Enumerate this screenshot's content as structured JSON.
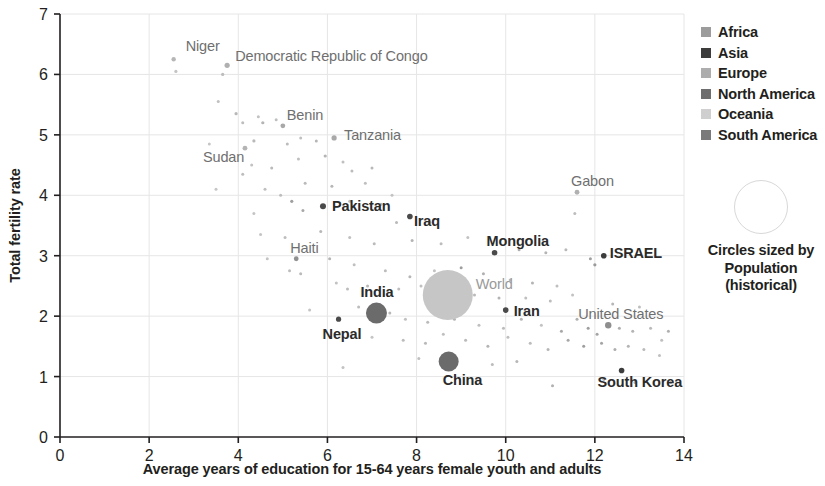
{
  "chart_data": {
    "type": "scatter",
    "title": "",
    "xlabel": "Average years of education for 15-64 years female youth and adults",
    "ylabel": "Total fertility rate",
    "xlim": [
      0,
      14
    ],
    "ylim": [
      0,
      7
    ],
    "xticks": [
      "0",
      "2",
      "4",
      "6",
      "8",
      "10",
      "12",
      "14"
    ],
    "yticks": [
      "0",
      "1",
      "2",
      "3",
      "4",
      "5",
      "6",
      "7"
    ],
    "grid": true,
    "legend_position": "right",
    "size_encoding": "Population (historical)",
    "legend": {
      "entries": [
        {
          "label": "Africa",
          "color": "#9c9c9c"
        },
        {
          "label": "Asia",
          "color": "#3c3c3c"
        },
        {
          "label": "Europe",
          "color": "#adadad"
        },
        {
          "label": "North America",
          "color": "#6e6e6e"
        },
        {
          "label": "Oceania",
          "color": "#cfcfcf"
        },
        {
          "label": "South America",
          "color": "#7a7a7a"
        }
      ]
    },
    "size_note": {
      "line1": "Circles sized by",
      "line2": "Population",
      "line3": "(historical)"
    },
    "labeled_points": [
      {
        "name": "Niger",
        "x": 2.55,
        "y": 6.25,
        "r": 2.2,
        "color": "#b6b6b6",
        "continent": "Africa",
        "label_dx": 12,
        "label_dy": -8,
        "label_style": "mid"
      },
      {
        "name": "Democratic Republic of Congo",
        "x": 3.75,
        "y": 6.15,
        "r": 2.6,
        "color": "#b0b0b0",
        "continent": "Africa",
        "label_dx": 8,
        "label_dy": -4,
        "label_style": "mid"
      },
      {
        "name": "Sudan",
        "x": 4.15,
        "y": 4.78,
        "r": 2.4,
        "color": "#b4b4b4",
        "continent": "Africa",
        "label_dx": -42,
        "label_dy": 14,
        "label_style": "mid"
      },
      {
        "name": "Benin",
        "x": 5.0,
        "y": 5.15,
        "r": 2.4,
        "color": "#a8a8a8",
        "continent": "Africa",
        "label_dx": 4,
        "label_dy": -6,
        "label_style": "mid"
      },
      {
        "name": "Tanzania",
        "x": 6.15,
        "y": 4.95,
        "r": 2.6,
        "color": "#a8a8a8",
        "continent": "Africa",
        "label_dx": 10,
        "label_dy": 2,
        "label_style": "mid"
      },
      {
        "name": "Pakistan",
        "x": 5.9,
        "y": 3.82,
        "r": 3.0,
        "color": "#4a4a4a",
        "continent": "Asia",
        "label_dx": 9,
        "label_dy": 5,
        "label_style": "dark"
      },
      {
        "name": "Iraq",
        "x": 7.85,
        "y": 3.65,
        "r": 2.8,
        "color": "#4a4a4a",
        "continent": "Asia",
        "label_dx": 4,
        "label_dy": 10,
        "label_style": "dark"
      },
      {
        "name": "Haiti",
        "x": 5.3,
        "y": 2.95,
        "r": 2.4,
        "color": "#909090",
        "continent": "North America",
        "label_dx": -6,
        "label_dy": -6,
        "label_style": "mid"
      },
      {
        "name": "Gabon",
        "x": 11.6,
        "y": 4.05,
        "r": 2.4,
        "color": "#b0b0b0",
        "continent": "Africa",
        "label_dx": -6,
        "label_dy": -6,
        "label_style": "mid"
      },
      {
        "name": "Mongolia",
        "x": 9.75,
        "y": 3.05,
        "r": 2.8,
        "color": "#4a4a4a",
        "continent": "Asia",
        "label_dx": -8,
        "label_dy": -7,
        "label_style": "dark"
      },
      {
        "name": "ISRAEL",
        "x": 12.2,
        "y": 3.0,
        "r": 2.8,
        "color": "#3c3c3c",
        "continent": "Asia",
        "label_dx": 6,
        "label_dy": 2,
        "label_style": "dark"
      },
      {
        "name": "World",
        "x": 8.7,
        "y": 2.35,
        "r": 25.0,
        "color": "#c6c6c6",
        "continent": "World",
        "label_dx": 28,
        "label_dy": -6,
        "label_style": "light"
      },
      {
        "name": "India",
        "x": 7.1,
        "y": 2.05,
        "r": 10.5,
        "color": "#6b6b6b",
        "continent": "Asia",
        "label_dx": -16,
        "label_dy": -16,
        "label_style": "dark"
      },
      {
        "name": "Nepal",
        "x": 6.25,
        "y": 1.95,
        "r": 2.6,
        "color": "#4a4a4a",
        "continent": "Asia",
        "label_dx": -16,
        "label_dy": 20,
        "label_style": "dark"
      },
      {
        "name": "Iran",
        "x": 10.0,
        "y": 2.1,
        "r": 2.8,
        "color": "#4a4a4a",
        "continent": "Asia",
        "label_dx": 8,
        "label_dy": 6,
        "label_style": "dark"
      },
      {
        "name": "China",
        "x": 8.72,
        "y": 1.25,
        "r": 10.0,
        "color": "#6b6b6b",
        "continent": "Asia",
        "label_dx": -6,
        "label_dy": 24,
        "label_style": "dark"
      },
      {
        "name": "United States",
        "x": 12.3,
        "y": 1.85,
        "r": 3.2,
        "color": "#8e8e8e",
        "continent": "North America",
        "label_dx": -30,
        "label_dy": -6,
        "label_style": "mid"
      },
      {
        "name": "South Korea",
        "x": 12.6,
        "y": 1.1,
        "r": 2.8,
        "color": "#3c3c3c",
        "continent": "Asia",
        "label_dx": -24,
        "label_dy": 16,
        "label_style": "dark"
      }
    ],
    "background_points": [
      {
        "x": 2.6,
        "y": 6.05,
        "r": 1.6,
        "color": "#c4c4c4"
      },
      {
        "x": 3.65,
        "y": 6.0,
        "r": 1.6,
        "color": "#bcbcbc"
      },
      {
        "x": 3.55,
        "y": 5.55,
        "r": 1.5,
        "color": "#c0c0c0"
      },
      {
        "x": 3.95,
        "y": 5.35,
        "r": 1.6,
        "color": "#b8b8b8"
      },
      {
        "x": 4.1,
        "y": 5.2,
        "r": 1.5,
        "color": "#bdbdbd"
      },
      {
        "x": 4.45,
        "y": 5.3,
        "r": 1.5,
        "color": "#c2c2c2"
      },
      {
        "x": 4.55,
        "y": 5.2,
        "r": 1.6,
        "color": "#b4b4b4"
      },
      {
        "x": 4.85,
        "y": 5.25,
        "r": 1.5,
        "color": "#bfbfbf"
      },
      {
        "x": 3.35,
        "y": 4.85,
        "r": 1.5,
        "color": "#c6c6c6"
      },
      {
        "x": 4.35,
        "y": 4.9,
        "r": 1.6,
        "color": "#b9b9b9"
      },
      {
        "x": 5.1,
        "y": 4.85,
        "r": 1.5,
        "color": "#bcbcbc"
      },
      {
        "x": 5.4,
        "y": 4.95,
        "r": 1.5,
        "color": "#c0c0c0"
      },
      {
        "x": 5.75,
        "y": 4.9,
        "r": 1.5,
        "color": "#b6b6b6"
      },
      {
        "x": 4.3,
        "y": 4.5,
        "r": 1.5,
        "color": "#c2c2c2"
      },
      {
        "x": 4.1,
        "y": 4.35,
        "r": 1.5,
        "color": "#bdbdbd"
      },
      {
        "x": 4.75,
        "y": 4.45,
        "r": 1.5,
        "color": "#bababa"
      },
      {
        "x": 5.35,
        "y": 4.6,
        "r": 1.5,
        "color": "#bfbfbf"
      },
      {
        "x": 5.95,
        "y": 4.65,
        "r": 1.6,
        "color": "#b4b4b4"
      },
      {
        "x": 6.35,
        "y": 4.55,
        "r": 1.5,
        "color": "#c0c0c0"
      },
      {
        "x": 6.55,
        "y": 4.4,
        "r": 1.5,
        "color": "#bcbcbc"
      },
      {
        "x": 7.0,
        "y": 4.45,
        "r": 1.5,
        "color": "#b8b8b8"
      },
      {
        "x": 3.5,
        "y": 4.1,
        "r": 1.5,
        "color": "#c6c6c6"
      },
      {
        "x": 4.6,
        "y": 4.1,
        "r": 1.5,
        "color": "#c0c0c0"
      },
      {
        "x": 4.95,
        "y": 4.0,
        "r": 1.5,
        "color": "#bdbdbd"
      },
      {
        "x": 5.5,
        "y": 4.2,
        "r": 1.5,
        "color": "#bababa"
      },
      {
        "x": 6.1,
        "y": 4.15,
        "r": 1.5,
        "color": "#b6b6b6"
      },
      {
        "x": 6.85,
        "y": 4.2,
        "r": 1.5,
        "color": "#bfbfbf"
      },
      {
        "x": 7.45,
        "y": 4.0,
        "r": 1.5,
        "color": "#c2c2c2"
      },
      {
        "x": 4.35,
        "y": 3.7,
        "r": 1.5,
        "color": "#c4c4c4"
      },
      {
        "x": 5.2,
        "y": 3.9,
        "r": 1.6,
        "color": "#9f9f9f"
      },
      {
        "x": 5.45,
        "y": 3.75,
        "r": 1.5,
        "color": "#a8a8a8"
      },
      {
        "x": 6.5,
        "y": 3.9,
        "r": 1.5,
        "color": "#bcbcbc"
      },
      {
        "x": 7.2,
        "y": 3.85,
        "r": 1.5,
        "color": "#b4b4b4"
      },
      {
        "x": 7.55,
        "y": 3.55,
        "r": 1.5,
        "color": "#b9b9b9"
      },
      {
        "x": 8.3,
        "y": 3.55,
        "r": 1.5,
        "color": "#c0c0c0"
      },
      {
        "x": 4.5,
        "y": 3.35,
        "r": 1.5,
        "color": "#c4c4c4"
      },
      {
        "x": 5.05,
        "y": 3.3,
        "r": 1.5,
        "color": "#bdbdbd"
      },
      {
        "x": 5.85,
        "y": 3.4,
        "r": 1.5,
        "color": "#b8b8b8"
      },
      {
        "x": 6.5,
        "y": 3.3,
        "r": 1.5,
        "color": "#c0c0c0"
      },
      {
        "x": 7.05,
        "y": 3.2,
        "r": 1.5,
        "color": "#bababa"
      },
      {
        "x": 7.9,
        "y": 3.25,
        "r": 1.5,
        "color": "#b4b4b4"
      },
      {
        "x": 8.55,
        "y": 3.2,
        "r": 1.5,
        "color": "#bcbcbc"
      },
      {
        "x": 9.15,
        "y": 3.3,
        "r": 1.5,
        "color": "#c2c2c2"
      },
      {
        "x": 10.3,
        "y": 3.1,
        "r": 1.5,
        "color": "#aeaeae"
      },
      {
        "x": 10.9,
        "y": 3.05,
        "r": 1.5,
        "color": "#b4b4b4"
      },
      {
        "x": 11.35,
        "y": 3.1,
        "r": 1.5,
        "color": "#b9b9b9"
      },
      {
        "x": 11.55,
        "y": 3.7,
        "r": 1.5,
        "color": "#bdbdbd"
      },
      {
        "x": 11.9,
        "y": 2.95,
        "r": 1.5,
        "color": "#a0a0a0"
      },
      {
        "x": 12.0,
        "y": 2.85,
        "r": 1.6,
        "color": "#9a9a9a"
      },
      {
        "x": 4.65,
        "y": 2.95,
        "r": 1.5,
        "color": "#c4c4c4"
      },
      {
        "x": 5.15,
        "y": 2.75,
        "r": 1.5,
        "color": "#bdbdbd"
      },
      {
        "x": 5.4,
        "y": 2.7,
        "r": 1.5,
        "color": "#bababa"
      },
      {
        "x": 6.05,
        "y": 2.95,
        "r": 1.5,
        "color": "#b4b4b4"
      },
      {
        "x": 6.6,
        "y": 2.85,
        "r": 1.5,
        "color": "#c0c0c0"
      },
      {
        "x": 7.3,
        "y": 2.75,
        "r": 1.5,
        "color": "#bcbcbc"
      },
      {
        "x": 7.85,
        "y": 2.65,
        "r": 1.5,
        "color": "#b6b6b6"
      },
      {
        "x": 8.4,
        "y": 2.75,
        "r": 1.5,
        "color": "#c2c2c2"
      },
      {
        "x": 9.0,
        "y": 2.8,
        "r": 1.5,
        "color": "#9e9e9e"
      },
      {
        "x": 9.5,
        "y": 2.7,
        "r": 1.5,
        "color": "#b0b0b0"
      },
      {
        "x": 10.1,
        "y": 2.6,
        "r": 1.5,
        "color": "#bababa"
      },
      {
        "x": 10.6,
        "y": 2.55,
        "r": 1.5,
        "color": "#b4b4b4"
      },
      {
        "x": 11.15,
        "y": 2.5,
        "r": 1.5,
        "color": "#bfbfbf"
      },
      {
        "x": 6.2,
        "y": 2.55,
        "r": 1.5,
        "color": "#c2c2c2"
      },
      {
        "x": 6.45,
        "y": 2.45,
        "r": 1.5,
        "color": "#bcbcbc"
      },
      {
        "x": 6.9,
        "y": 2.5,
        "r": 1.5,
        "color": "#b6b6b6"
      },
      {
        "x": 7.6,
        "y": 2.45,
        "r": 1.5,
        "color": "#bdbdbd"
      },
      {
        "x": 8.1,
        "y": 2.5,
        "r": 1.5,
        "color": "#c0c0c0"
      },
      {
        "x": 9.3,
        "y": 2.35,
        "r": 1.5,
        "color": "#bababa"
      },
      {
        "x": 9.85,
        "y": 2.3,
        "r": 1.5,
        "color": "#b4b4b4"
      },
      {
        "x": 10.45,
        "y": 2.3,
        "r": 1.5,
        "color": "#bfbfbf"
      },
      {
        "x": 11.0,
        "y": 2.25,
        "r": 1.5,
        "color": "#bcbcbc"
      },
      {
        "x": 11.5,
        "y": 2.35,
        "r": 1.5,
        "color": "#c2c2c2"
      },
      {
        "x": 12.4,
        "y": 2.2,
        "r": 1.5,
        "color": "#b6b6b6"
      },
      {
        "x": 13.0,
        "y": 2.15,
        "r": 1.5,
        "color": "#bdbdbd"
      },
      {
        "x": 13.65,
        "y": 1.75,
        "r": 1.5,
        "color": "#b0b0b0"
      },
      {
        "x": 5.6,
        "y": 2.1,
        "r": 1.5,
        "color": "#c4c4c4"
      },
      {
        "x": 6.7,
        "y": 2.15,
        "r": 1.5,
        "color": "#bcbcbc"
      },
      {
        "x": 7.4,
        "y": 2.05,
        "r": 1.5,
        "color": "#b8b8b8"
      },
      {
        "x": 7.75,
        "y": 1.95,
        "r": 1.5,
        "color": "#c0c0c0"
      },
      {
        "x": 8.25,
        "y": 1.9,
        "r": 1.5,
        "color": "#bababa"
      },
      {
        "x": 8.85,
        "y": 1.95,
        "r": 1.5,
        "color": "#b4b4b4"
      },
      {
        "x": 9.4,
        "y": 1.85,
        "r": 1.5,
        "color": "#bfbfbf"
      },
      {
        "x": 9.95,
        "y": 1.8,
        "r": 1.5,
        "color": "#bcbcbc"
      },
      {
        "x": 10.35,
        "y": 1.95,
        "r": 1.5,
        "color": "#b6b6b6"
      },
      {
        "x": 10.8,
        "y": 1.85,
        "r": 1.5,
        "color": "#c2c2c2"
      },
      {
        "x": 11.25,
        "y": 1.75,
        "r": 1.5,
        "color": "#a8a8a8"
      },
      {
        "x": 11.6,
        "y": 1.95,
        "r": 1.5,
        "color": "#b0b0b0"
      },
      {
        "x": 11.85,
        "y": 1.8,
        "r": 1.5,
        "color": "#9e9e9e"
      },
      {
        "x": 12.05,
        "y": 1.7,
        "r": 1.5,
        "color": "#a4a4a4"
      },
      {
        "x": 12.55,
        "y": 1.8,
        "r": 1.5,
        "color": "#aeaeae"
      },
      {
        "x": 12.85,
        "y": 1.75,
        "r": 1.5,
        "color": "#b4b4b4"
      },
      {
        "x": 13.25,
        "y": 1.8,
        "r": 1.5,
        "color": "#bababa"
      },
      {
        "x": 13.5,
        "y": 1.6,
        "r": 1.5,
        "color": "#c0c0c0"
      },
      {
        "x": 7.0,
        "y": 1.65,
        "r": 1.5,
        "color": "#c4c4c4"
      },
      {
        "x": 7.7,
        "y": 1.6,
        "r": 1.5,
        "color": "#bcbcbc"
      },
      {
        "x": 8.2,
        "y": 1.55,
        "r": 1.5,
        "color": "#b8b8b8"
      },
      {
        "x": 8.6,
        "y": 1.7,
        "r": 1.5,
        "color": "#c0c0c0"
      },
      {
        "x": 9.1,
        "y": 1.6,
        "r": 1.5,
        "color": "#bababa"
      },
      {
        "x": 9.6,
        "y": 1.5,
        "r": 1.5,
        "color": "#b4b4b4"
      },
      {
        "x": 10.05,
        "y": 1.65,
        "r": 1.5,
        "color": "#bfbfbf"
      },
      {
        "x": 10.55,
        "y": 1.55,
        "r": 1.5,
        "color": "#bcbcbc"
      },
      {
        "x": 10.95,
        "y": 1.45,
        "r": 1.5,
        "color": "#b6b6b6"
      },
      {
        "x": 11.4,
        "y": 1.6,
        "r": 1.5,
        "color": "#a8a8a8"
      },
      {
        "x": 11.75,
        "y": 1.5,
        "r": 1.5,
        "color": "#9e9e9e"
      },
      {
        "x": 12.15,
        "y": 1.55,
        "r": 1.5,
        "color": "#a4a4a4"
      },
      {
        "x": 12.45,
        "y": 1.45,
        "r": 1.5,
        "color": "#aeaeae"
      },
      {
        "x": 12.75,
        "y": 1.5,
        "r": 1.5,
        "color": "#b4b4b4"
      },
      {
        "x": 13.1,
        "y": 1.45,
        "r": 1.5,
        "color": "#bababa"
      },
      {
        "x": 13.45,
        "y": 1.35,
        "r": 1.5,
        "color": "#c0c0c0"
      },
      {
        "x": 11.05,
        "y": 0.85,
        "r": 1.5,
        "color": "#b0b0b0"
      },
      {
        "x": 12.2,
        "y": 0.95,
        "r": 1.5,
        "color": "#b8b8b8"
      },
      {
        "x": 12.9,
        "y": 0.9,
        "r": 1.5,
        "color": "#b0b0b0"
      },
      {
        "x": 13.7,
        "y": 0.9,
        "r": 1.5,
        "color": "#a8a8a8"
      },
      {
        "x": 6.35,
        "y": 1.15,
        "r": 1.5,
        "color": "#c2c2c2"
      },
      {
        "x": 9.7,
        "y": 1.2,
        "r": 1.5,
        "color": "#bcbcbc"
      },
      {
        "x": 10.25,
        "y": 1.25,
        "r": 1.5,
        "color": "#b6b6b6"
      },
      {
        "x": 8.05,
        "y": 1.3,
        "r": 1.5,
        "color": "#bfbfbf"
      }
    ]
  }
}
